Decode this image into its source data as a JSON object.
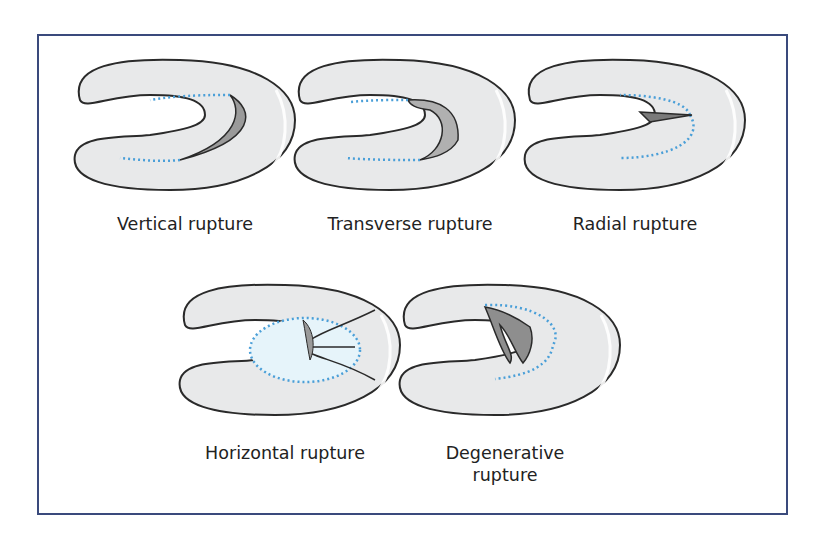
{
  "figure": {
    "colors": {
      "border": "#3a4a7c",
      "meniscus_fill": "#e8e9ea",
      "meniscus_outline": "#2a2a2a",
      "dotted_line": "#4a9fd8",
      "tear_shadow": "#8e8e8e",
      "highlight_zone": "#e6f4fa"
    },
    "panels": [
      {
        "label": "Vertical rupture"
      },
      {
        "label": "Transverse rupture"
      },
      {
        "label": "Radial rupture"
      },
      {
        "label": "Horizontal rupture"
      },
      {
        "label_line1": "Degenerative",
        "label_line2": "rupture"
      }
    ]
  }
}
